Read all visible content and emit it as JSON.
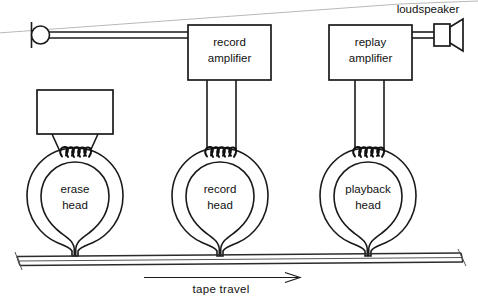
{
  "diagram": {
    "scan_artifact": "diagonal-scan-line",
    "colors": {
      "ink": "#1a1a1a",
      "paper": "#ffffff",
      "scanline": "#b9b9b9"
    },
    "source": {
      "microphone_label": "",
      "loudspeaker_label": "loudspeaker"
    },
    "amplifiers": [
      {
        "id": "erase-oscillator",
        "line1": "",
        "line2": ""
      },
      {
        "id": "record-amplifier",
        "line1": "record",
        "line2": "amplifier"
      },
      {
        "id": "replay-amplifier",
        "line1": "replay",
        "line2": "amplifier"
      }
    ],
    "heads": [
      {
        "id": "erase-head",
        "line1": "erase",
        "line2": "head"
      },
      {
        "id": "record-head",
        "line1": "record",
        "line2": "head"
      },
      {
        "id": "playback-head",
        "line1": "playback",
        "line2": "head"
      }
    ],
    "tape": {
      "travel_label": "tape  travel",
      "direction": "right"
    }
  }
}
